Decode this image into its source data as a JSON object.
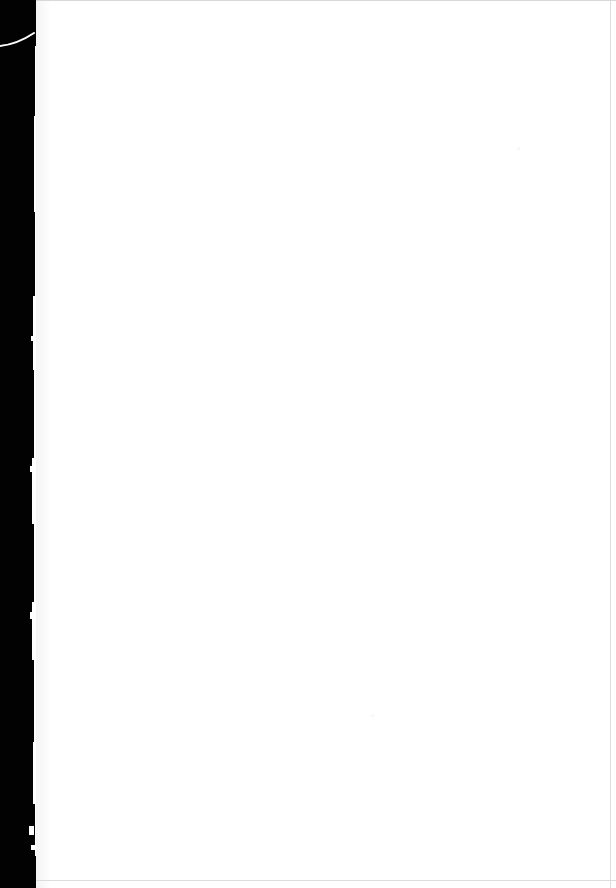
{
  "document": {
    "type": "scanned-page",
    "page_content": "",
    "page_note": "blank page"
  },
  "canvas": {
    "width": 616,
    "height": 888,
    "background_color": "#ffffff"
  },
  "scan": {
    "backdrop_color": "#020202",
    "paper_color": "#ffffff",
    "edge_line_color": "#dcdcdc",
    "paper_left_edge_x": 36,
    "paper_right_edge_x": 610,
    "backdrop_width": 44
  },
  "artifacts": {
    "corner_curl_label": "corner-curl-streak",
    "speck_label": "scan-speck",
    "specks": [
      {
        "x": 517,
        "y": 147,
        "size": 3
      },
      {
        "x": 371,
        "y": 714,
        "size": 3
      }
    ]
  }
}
